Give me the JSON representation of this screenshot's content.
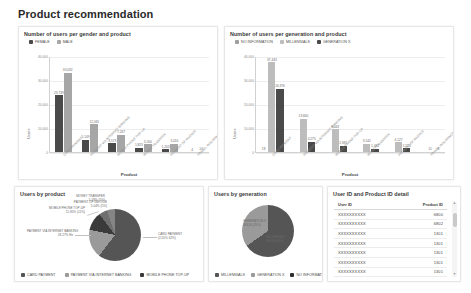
{
  "page": {
    "title": "Product recommendation"
  },
  "colors": {
    "female": "#4a4a4a",
    "male": "#a6a6a6",
    "no_information": "#9e9e9e",
    "millennials": "#bdbdbd",
    "generation_x": "#4a4a4a",
    "pie_card": "#555555",
    "pie_internet": "#9a9a9a",
    "pie_mobile": "#3a3a3a",
    "grid": "#ededed",
    "axis": "#d2d2d2"
  },
  "gender_chart": {
    "title": "Number of users per gender and product",
    "legend": [
      {
        "label": "FEMALE",
        "color": "#4a4a4a"
      },
      {
        "label": "MALE",
        "color": "#a6a6a6"
      }
    ],
    "chart_data": {
      "type": "bar",
      "title": "Number of users per gender and product",
      "xlabel": "Product",
      "ylabel": "Users",
      "ylim": [
        0,
        40000
      ],
      "yticks": [
        0,
        10000,
        20000,
        30000,
        40000
      ],
      "ytick_labels": [
        "0",
        "10,000",
        "20,000",
        "30,000",
        "40,000"
      ],
      "grid": true,
      "legend_position": "top-left",
      "categories": [
        "CARD PAYMENT",
        "PAYMENT VIA INTERNET BANKING",
        "MOBILE PHONE TOP-UP",
        "MONEY TRANSFER",
        "PAYMENT OF INVOICE",
        "TRAVEL INSURANCE"
      ],
      "series": [
        {
          "name": "FEMALE",
          "color": "#4a4a4a",
          "values": [
            23739,
            5149,
            3573,
            1823,
            1203,
            4
          ],
          "value_labels": [
            "23,739",
            "5,149",
            "3,573",
            "1,823",
            "1,203",
            "4"
          ]
        },
        {
          "name": "MALE",
          "color": "#a6a6a6",
          "values": [
            33032,
            11565,
            7267,
            3200,
            3410,
            14
          ],
          "value_labels": [
            "33,032",
            "11,565",
            "7,267",
            "3,200",
            "3,410",
            "14"
          ]
        }
      ]
    }
  },
  "generation_chart": {
    "title": "Number of users per generation and product",
    "legend": [
      {
        "label": "NO INFORMATION",
        "color": "#9e9e9e"
      },
      {
        "label": "MILLENNIALS",
        "color": "#bdbdbd"
      },
      {
        "label": "GENERATION X",
        "color": "#4a4a4a"
      }
    ],
    "chart_data": {
      "type": "bar",
      "title": "Number of users per generation and product",
      "xlabel": "Product",
      "ylabel": "Users",
      "ylim": [
        0,
        40000
      ],
      "yticks": [
        0,
        10000,
        20000,
        30000,
        40000
      ],
      "ytick_labels": [
        "0",
        "10,000",
        "20,000",
        "30,000",
        "40,000"
      ],
      "grid": true,
      "legend_position": "top-left",
      "categories": [
        "CARD PAYMENT",
        "PAYMENT VIA INTERNET BANKING",
        "MOBILE PHONE TOP-UP",
        "MONEY TRANSFER",
        "PAYMENT OF INVOICE",
        "TRAVEL INSURANCE"
      ],
      "series": [
        {
          "name": "NO INFORMATION",
          "color": "#9e9e9e",
          "values": [
            18,
            0,
            0,
            0,
            0,
            0
          ],
          "value_labels": [
            "18",
            "",
            "",
            "",
            "",
            ""
          ]
        },
        {
          "name": "MILLENNIALS",
          "color": "#bdbdbd",
          "values": [
            37443,
            13840,
            9443,
            3542,
            4127,
            11
          ],
          "value_labels": [
            "37,443",
            "13,840",
            "9,443",
            "3,542",
            "4,127",
            "11"
          ]
        },
        {
          "name": "GENERATION X",
          "color": "#4a4a4a",
          "values": [
            26376,
            4275,
            2681,
            1462,
            1513,
            8
          ],
          "value_labels": [
            "26,376",
            "4,275",
            "2,681",
            "1,462",
            "1,513",
            "8"
          ]
        }
      ]
    }
  },
  "product_pie": {
    "title": "Users by product",
    "legend": [
      {
        "label": "CARD PAYMENT",
        "color": "#555555"
      },
      {
        "label": "PAYMENT VIA INTERNET BANKING",
        "color": "#9a9a9a"
      },
      {
        "label": "MOBILE PHONE TOP-UP",
        "color": "#3a3a3a"
      }
    ],
    "chart_data": {
      "type": "pie",
      "title": "Users by product",
      "legend_position": "bottom",
      "labels": [
        "CARD PAYMENT",
        "PAYMENT VIA INTERNET BANKING",
        "MOBILE PHONE TOP-UP",
        "MONEY TRANSFER",
        "PAYMENT OF INVOICE"
      ],
      "values": [
        56771,
        16714,
        10840,
        5023,
        4613
      ],
      "percentages": [
        62.05,
        18.27,
        11.85,
        5.49,
        5.04
      ],
      "annotations": [
        {
          "text": "CARD PAYMENT\n(2.05% 62%)",
          "label": "CARD PAYMENT",
          "value": "(2.05% 62%)"
        },
        {
          "text": "PAYMENT VIA INTERNET BANKING\n18.27% Hz",
          "label": "PAYMENT VIA INTERNET BANKING",
          "value": "18.27% Hz"
        },
        {
          "text": "MOBILE PHONE TOP-UP\n11.85% (11%)",
          "label": "MOBILE PHONE TOP-UP",
          "value": "11.85% (11%)"
        },
        {
          "text": "MONEY TRANSFER\n5.49% (5%)",
          "label": "MONEY TRANSFER",
          "value": "5.49% (5%)"
        },
        {
          "text": "PAYMENT OF INVOICE\n5.04% (5%)",
          "label": "PAYMENT OF INVOICE",
          "value": "5.04% (5%)"
        }
      ]
    }
  },
  "generation_pie": {
    "title": "Users by generation",
    "legend": [
      {
        "label": "MILLENNIALS",
        "color": "#555555"
      },
      {
        "label": "GENERATION X",
        "color": "#9a9a9a"
      },
      {
        "label": "NO INFORMATION",
        "color": "#2f2f2f"
      }
    ],
    "chart_data": {
      "type": "pie",
      "title": "Users by generation",
      "legend_position": "bottom",
      "labels": [
        "MILLENNIALS",
        "GENERATION X",
        "NO INFORMATION"
      ],
      "values": [
        68406,
        36316,
        18
      ],
      "percentages": [
        65.32,
        34.66,
        0.02
      ],
      "annotations": [
        {
          "text": "GENERATION X\n36316 (35%)",
          "label": "GENERATION X",
          "value": "36316 (35%)"
        },
        {
          "text": "MILLENNIALS\n68406 (65%)",
          "label": "MILLENNIALS",
          "value": "68406 (65%)"
        }
      ]
    }
  },
  "detail_table": {
    "title": "User ID and Product ID detail",
    "chart_data": {
      "type": "table",
      "columns": [
        "User ID",
        "Product ID"
      ],
      "rows": [
        [
          "XXXXXXXXXX",
          "6800"
        ],
        [
          "XXXXXXXXXX",
          "6802"
        ],
        [
          "XXXXXXXXXX",
          "1301"
        ],
        [
          "XXXXXXXXXX",
          "1301"
        ],
        [
          "XXXXXXXXXX",
          "1301"
        ],
        [
          "XXXXXXXXXX",
          "1301"
        ],
        [
          "XXXXXXXXXX",
          "1301"
        ]
      ]
    },
    "scroll": {
      "up": "▲",
      "down": "▼"
    }
  }
}
